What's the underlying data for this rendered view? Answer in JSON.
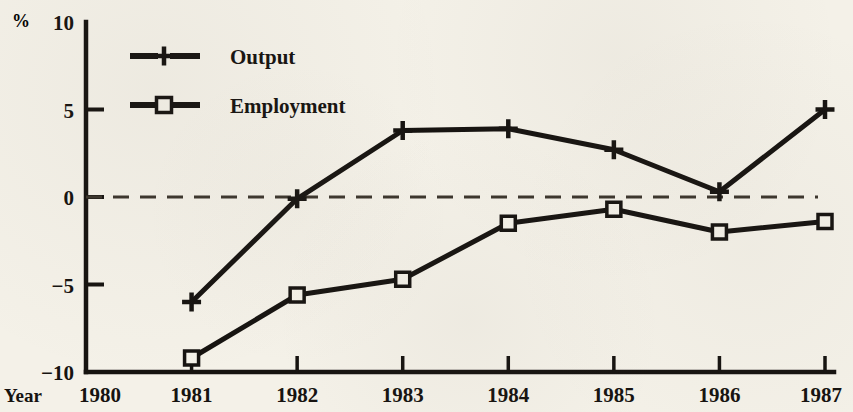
{
  "figure": {
    "background_color": "#f4f1e8",
    "ink_color": "#161310",
    "percent_symbol": "%",
    "x_axis_title": "Year"
  },
  "legend": {
    "position": "top-left-inside",
    "entries": [
      {
        "label": "Output",
        "marker": "plus-icon",
        "marker_type": "plus"
      },
      {
        "label": "Employment",
        "marker": "square-icon",
        "marker_type": "open-square"
      }
    ]
  },
  "chart_data": {
    "type": "line",
    "title": "",
    "subtitle": "",
    "xlabel": "Year",
    "ylabel": "%",
    "x": [
      1980,
      1981,
      1982,
      1983,
      1984,
      1985,
      1986,
      1987
    ],
    "categories": [
      "1980",
      "1981",
      "1982",
      "1983",
      "1984",
      "1985",
      "1986",
      "1987"
    ],
    "xlim": [
      1980,
      1987
    ],
    "ylim": [
      -10,
      10
    ],
    "yticks": [
      -10,
      -5,
      0,
      5,
      10
    ],
    "ytick_labels": [
      "−10",
      "−5",
      "0",
      "5",
      "10"
    ],
    "xticks": [
      1980,
      1981,
      1982,
      1983,
      1984,
      1985,
      1986,
      1987
    ],
    "xtick_labels": [
      "1980",
      "1981",
      "1982",
      "1983",
      "1984",
      "1985",
      "1986",
      "1987"
    ],
    "grid": false,
    "zero_line": {
      "value": 0,
      "style": "dashed"
    },
    "legend": "top-left",
    "series": [
      {
        "name": "Output",
        "marker": "plus",
        "x": [
          1981,
          1982,
          1983,
          1984,
          1985,
          1986,
          1987
        ],
        "values": [
          -6.0,
          -0.1,
          3.8,
          3.9,
          2.7,
          0.3,
          5.0
        ]
      },
      {
        "name": "Employment",
        "marker": "open-square",
        "x": [
          1981,
          1982,
          1983,
          1984,
          1985,
          1986,
          1987
        ],
        "values": [
          -9.2,
          -5.6,
          -4.7,
          -1.5,
          -0.7,
          -2.0,
          -1.4
        ]
      }
    ]
  }
}
